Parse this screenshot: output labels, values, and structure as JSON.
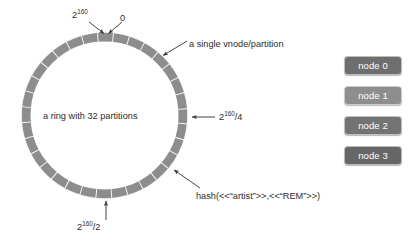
{
  "diagram": {
    "ring": {
      "center_x": 104.5,
      "center_y": 115.5,
      "radius": 78.5,
      "band_width": 9,
      "partitions": 32,
      "band_color": "#8d8d8d",
      "divider_color": "#ffffff"
    },
    "center_label": "a ring with 32 partitions",
    "labels": {
      "top_max": {
        "base": "2",
        "exp": "160"
      },
      "top_zero": "0",
      "bottom": {
        "base": "2",
        "exp": "160",
        "suffix": "/2"
      },
      "right_quarter": {
        "base": "2",
        "exp": "160",
        "suffix": "/4"
      },
      "vnode": "a single vnode/partition",
      "hash": "hash(<<“artist”>>,<<“REM”>>)"
    },
    "arrow_color": "#3a3a3a"
  },
  "legend": {
    "items": [
      {
        "label": "node 0",
        "color": "#6e6e6e"
      },
      {
        "label": "node 1",
        "color": "#8e8e8e"
      },
      {
        "label": "node 2",
        "color": "#737373"
      },
      {
        "label": "node 3",
        "color": "#666666"
      }
    ]
  }
}
